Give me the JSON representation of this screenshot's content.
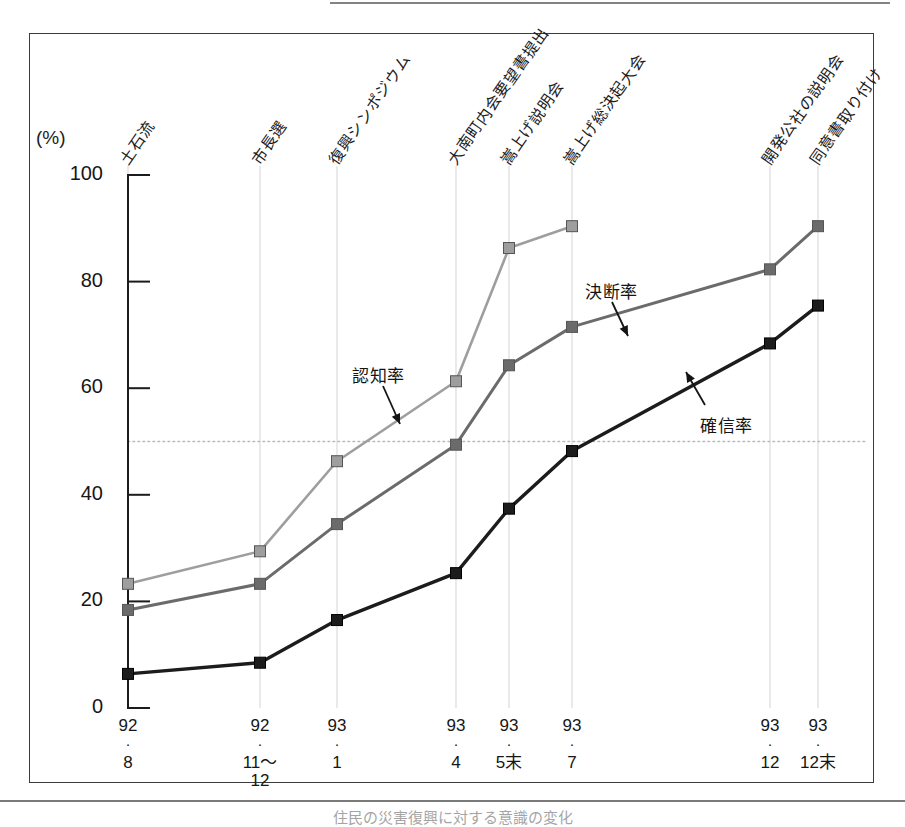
{
  "figure": {
    "y_axis_unit": "(%)",
    "page_folio": "",
    "caption": "住民の災害復興に対する意識の変化"
  },
  "chart_data": {
    "type": "line",
    "title": "",
    "xlabel": "",
    "ylabel": "(%)",
    "ylim": [
      0,
      100
    ],
    "yticks": [
      0,
      20,
      40,
      60,
      80,
      100
    ],
    "ytick_labels": [
      "0",
      "20",
      "40",
      "60",
      "80",
      "100"
    ],
    "grid": "vertical event lines only",
    "reference_line": {
      "value": 50,
      "style": "dotted"
    },
    "legend_position": "inline annotations with arrows",
    "x": [
      "92.8",
      "92.11～12",
      "93.1",
      "93.4",
      "93.5末",
      "93.7",
      "93.12",
      "93.12末"
    ],
    "xtick_labels": [
      {
        "year": "92",
        "dot": "・",
        "month": "8",
        "month2": ""
      },
      {
        "year": "92",
        "dot": "・",
        "month": "11～",
        "month2": "12"
      },
      {
        "year": "93",
        "dot": "・",
        "month": "1",
        "month2": ""
      },
      {
        "year": "93",
        "dot": "・",
        "month": "4",
        "month2": ""
      },
      {
        "year": "93",
        "dot": "・",
        "month": "5末",
        "month2": ""
      },
      {
        "year": "93",
        "dot": "・",
        "month": "7",
        "month2": ""
      },
      {
        "year": "93",
        "dot": "・",
        "month": "12",
        "month2": ""
      },
      {
        "year": "93",
        "dot": "・",
        "month": "12末",
        "month2": ""
      }
    ],
    "series": [
      {
        "name": "認知率",
        "color": "#9e9e9e",
        "marker": "square",
        "values": [
          23.3,
          29.4,
          46.3,
          61.3,
          86.3,
          90.4,
          null,
          null
        ]
      },
      {
        "name": "決断率",
        "color": "#6b6b6b",
        "marker": "square",
        "values": [
          18.4,
          23.3,
          34.5,
          49.4,
          64.3,
          71.5,
          82.3,
          90.4
        ]
      },
      {
        "name": "確信率",
        "color": "#1c1c1c",
        "marker": "square",
        "values": [
          6.4,
          8.5,
          16.5,
          25.3,
          37.4,
          48.2,
          68.4,
          75.5
        ]
      }
    ],
    "events": [
      {
        "label": "土石流",
        "x_index": 0
      },
      {
        "label": "市長選",
        "x_index": 1
      },
      {
        "label": "復興シンポジウム",
        "x_index": 2
      },
      {
        "label": "大南町内会要望書提出",
        "x_index": 3
      },
      {
        "label": "嵩上げ説明会",
        "x_index": 4
      },
      {
        "label": "嵩上げ総決起大会",
        "x_index": 5
      },
      {
        "label": "開発公社の説明会",
        "x_index": 6
      },
      {
        "label": "同意書取り付け",
        "x_index": 7
      }
    ],
    "annotations": [
      {
        "text": "認知率",
        "series": "認知率"
      },
      {
        "text": "決断率",
        "series": "決断率"
      },
      {
        "text": "確信率",
        "series": "確信率"
      }
    ]
  },
  "colors": {
    "awareness": "#9e9e9e",
    "decision": "#6b6b6b",
    "conviction": "#1c1c1c",
    "axis": "#1c1c1c",
    "frame": "#3b3b3b",
    "event_gridline": "#d8d8d8",
    "reference_line": "#b9b9b9"
  }
}
